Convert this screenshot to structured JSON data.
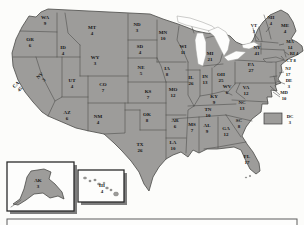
{
  "map": {
    "states": [
      {
        "abbr": "WA",
        "votes": 9
      },
      {
        "abbr": "OR",
        "votes": 6
      },
      {
        "abbr": "CA",
        "votes": 45
      },
      {
        "abbr": "NV",
        "votes": 3
      },
      {
        "abbr": "ID",
        "votes": 4
      },
      {
        "abbr": "MT",
        "votes": 4
      },
      {
        "abbr": "WY",
        "votes": 3
      },
      {
        "abbr": "UT",
        "votes": 4
      },
      {
        "abbr": "CO",
        "votes": 7
      },
      {
        "abbr": "AZ",
        "votes": 6
      },
      {
        "abbr": "NM",
        "votes": 4
      },
      {
        "abbr": "ND",
        "votes": 3
      },
      {
        "abbr": "SD",
        "votes": 4
      },
      {
        "abbr": "NE",
        "votes": 5
      },
      {
        "abbr": "KS",
        "votes": 7
      },
      {
        "abbr": "OK",
        "votes": 8
      },
      {
        "abbr": "TX",
        "votes": 26
      },
      {
        "abbr": "MN",
        "votes": 10
      },
      {
        "abbr": "IA",
        "votes": 8
      },
      {
        "abbr": "MO",
        "votes": 12
      },
      {
        "abbr": "AR",
        "votes": 6
      },
      {
        "abbr": "LA",
        "votes": 10
      },
      {
        "abbr": "WI",
        "votes": 11
      },
      {
        "abbr": "IL",
        "votes": 26
      },
      {
        "abbr": "MS",
        "votes": 7
      },
      {
        "abbr": "MI",
        "votes": 21
      },
      {
        "abbr": "IN",
        "votes": 13
      },
      {
        "abbr": "OH",
        "votes": 25
      },
      {
        "abbr": "KY",
        "votes": 9
      },
      {
        "abbr": "TN",
        "votes": 10
      },
      {
        "abbr": "AL",
        "votes": 9
      },
      {
        "abbr": "GA",
        "votes": 12
      },
      {
        "abbr": "FL",
        "votes": 17
      },
      {
        "abbr": "SC",
        "votes": 8
      },
      {
        "abbr": "NC",
        "votes": 13
      },
      {
        "abbr": "VA",
        "votes": 12
      },
      {
        "abbr": "WV",
        "votes": 6
      },
      {
        "abbr": "PA",
        "votes": 27
      },
      {
        "abbr": "NY",
        "votes": 41
      },
      {
        "abbr": "ME",
        "votes": 4
      },
      {
        "abbr": "VT",
        "votes": 3
      },
      {
        "abbr": "NH",
        "votes": 4
      },
      {
        "abbr": "MA",
        "votes": 14
      },
      {
        "abbr": "RI",
        "votes": 4
      },
      {
        "abbr": "CT",
        "votes": 8
      },
      {
        "abbr": "NJ",
        "votes": 17
      },
      {
        "abbr": "DE",
        "votes": 3
      },
      {
        "abbr": "MD",
        "votes": 10
      }
    ],
    "dc": {
      "abbr": "DC",
      "votes": 3
    },
    "alaska_inset": {
      "abbr": "AK",
      "votes": 3
    },
    "hawaii_inset": {
      "abbr": "HI",
      "votes": 4
    },
    "colors": {
      "land": "#9d9c9a",
      "state_border": "#4a4a48",
      "water": "#fdfdfc",
      "label": "#161616"
    }
  }
}
